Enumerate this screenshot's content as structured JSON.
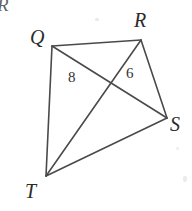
{
  "figure": {
    "background_color": "#ffffff",
    "stroke_color": "#4a4a4a",
    "label_color": "#2b2b2b",
    "width": 192,
    "height": 211,
    "corner_artifact": "R",
    "vertices": [
      {
        "name": "Q",
        "label": "Q",
        "x": 52,
        "y": 46,
        "label_x": 30,
        "label_y": 27
      },
      {
        "name": "R",
        "label": "R",
        "x": 141,
        "y": 40,
        "label_x": 134,
        "label_y": 10
      },
      {
        "name": "S",
        "label": "S",
        "x": 167,
        "y": 118,
        "label_x": 170,
        "label_y": 114
      },
      {
        "name": "T",
        "label": "T",
        "x": 46,
        "y": 176,
        "label_x": 25,
        "label_y": 181
      }
    ],
    "edges": [
      {
        "name": "QR",
        "from": "Q",
        "to": "R"
      },
      {
        "name": "RS",
        "from": "R",
        "to": "S"
      },
      {
        "name": "ST",
        "from": "S",
        "to": "T"
      },
      {
        "name": "TQ",
        "from": "T",
        "to": "Q"
      }
    ],
    "diagonals": [
      {
        "name": "QS",
        "from": "Q",
        "to": "S"
      },
      {
        "name": "RT",
        "from": "R",
        "to": "T"
      }
    ],
    "intersection": {
      "name": "P",
      "x": 107,
      "y": 87
    },
    "segment_labels": [
      {
        "name": "segment-8",
        "text": "8",
        "x": 68,
        "y": 70,
        "segment": "QS"
      },
      {
        "name": "segment-6",
        "text": "6",
        "x": 126,
        "y": 66,
        "segment": "RS"
      }
    ]
  }
}
